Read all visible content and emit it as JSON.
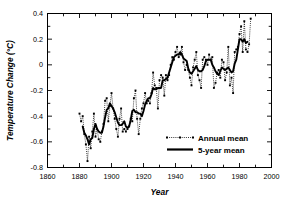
{
  "chart_data": {
    "type": "line",
    "title": "",
    "xlabel": "Year",
    "ylabel": "Temperature Change (°C)",
    "xlim": [
      1860,
      2000
    ],
    "ylim": [
      -0.8,
      0.4
    ],
    "xticks": [
      1860,
      1880,
      1900,
      1920,
      1940,
      1960,
      1980,
      2000
    ],
    "xtick_labels": [
      "1860",
      "1880",
      "1900",
      "1920",
      "1940",
      "1960",
      "1980",
      "2000"
    ],
    "xminor_step": 10,
    "yticks": [
      -0.8,
      -0.6,
      -0.4,
      -0.2,
      0,
      0.2,
      0.4
    ],
    "ytick_labels": [
      "-0.8",
      "-0.6",
      "-0.4",
      "-0.2",
      "0",
      "0.2",
      "0.4"
    ],
    "grid": false,
    "legend_position": "lower-right",
    "frame": true,
    "series": [
      {
        "name": "Annual mean",
        "style": "dotted-with-square-markers",
        "color": "#000000",
        "x": [
          1880,
          1881,
          1882,
          1883,
          1884,
          1885,
          1886,
          1887,
          1888,
          1889,
          1890,
          1891,
          1892,
          1893,
          1894,
          1895,
          1896,
          1897,
          1898,
          1899,
          1900,
          1901,
          1902,
          1903,
          1904,
          1905,
          1906,
          1907,
          1908,
          1909,
          1910,
          1911,
          1912,
          1913,
          1914,
          1915,
          1916,
          1917,
          1918,
          1919,
          1920,
          1921,
          1922,
          1923,
          1924,
          1925,
          1926,
          1927,
          1928,
          1929,
          1930,
          1931,
          1932,
          1933,
          1934,
          1935,
          1936,
          1937,
          1938,
          1939,
          1940,
          1941,
          1942,
          1943,
          1944,
          1945,
          1946,
          1947,
          1948,
          1949,
          1950,
          1951,
          1952,
          1953,
          1954,
          1955,
          1956,
          1957,
          1958,
          1959,
          1960,
          1961,
          1962,
          1963,
          1964,
          1965,
          1966,
          1967,
          1968,
          1969,
          1970,
          1971,
          1972,
          1973,
          1974,
          1975,
          1976,
          1977,
          1978,
          1979,
          1980,
          1981,
          1982,
          1983,
          1984,
          1985,
          1986,
          1987
        ],
        "values": [
          -0.38,
          -0.44,
          -0.4,
          -0.54,
          -0.62,
          -0.75,
          -0.56,
          -0.65,
          -0.52,
          -0.38,
          -0.56,
          -0.5,
          -0.58,
          -0.6,
          -0.52,
          -0.46,
          -0.28,
          -0.26,
          -0.44,
          -0.32,
          -0.22,
          -0.34,
          -0.42,
          -0.5,
          -0.56,
          -0.42,
          -0.34,
          -0.52,
          -0.5,
          -0.52,
          -0.5,
          -0.48,
          -0.42,
          -0.44,
          -0.26,
          -0.2,
          -0.42,
          -0.54,
          -0.42,
          -0.34,
          -0.3,
          -0.22,
          -0.3,
          -0.28,
          -0.3,
          -0.22,
          -0.06,
          -0.16,
          -0.18,
          -0.34,
          -0.12,
          -0.08,
          -0.1,
          -0.24,
          -0.08,
          -0.12,
          -0.08,
          0.0,
          0.06,
          0.04,
          0.1,
          0.14,
          0.06,
          0.08,
          0.14,
          0.02,
          -0.04,
          0.0,
          -0.04,
          -0.1,
          -0.16,
          -0.02,
          0.04,
          0.1,
          -0.08,
          -0.12,
          -0.18,
          0.04,
          0.06,
          0.04,
          0.0,
          0.08,
          0.04,
          0.06,
          -0.18,
          -0.14,
          -0.06,
          -0.04,
          -0.1,
          0.04,
          0.02,
          -0.12,
          -0.06,
          0.14,
          -0.16,
          -0.1,
          -0.22,
          0.1,
          0.12,
          0.14,
          0.24,
          0.3,
          0.1,
          0.34,
          0.12,
          0.1,
          0.16,
          0.36
        ]
      },
      {
        "name": "5-year mean",
        "style": "thick-solid",
        "color": "#000000",
        "x": [
          1882,
          1883,
          1884,
          1885,
          1886,
          1887,
          1888,
          1889,
          1890,
          1891,
          1892,
          1893,
          1894,
          1895,
          1896,
          1897,
          1898,
          1899,
          1900,
          1901,
          1902,
          1903,
          1904,
          1905,
          1906,
          1907,
          1908,
          1909,
          1910,
          1911,
          1912,
          1913,
          1914,
          1915,
          1916,
          1917,
          1918,
          1919,
          1920,
          1921,
          1922,
          1923,
          1924,
          1925,
          1926,
          1927,
          1928,
          1929,
          1930,
          1931,
          1932,
          1933,
          1934,
          1935,
          1936,
          1937,
          1938,
          1939,
          1940,
          1941,
          1942,
          1943,
          1944,
          1945,
          1946,
          1947,
          1948,
          1949,
          1950,
          1951,
          1952,
          1953,
          1954,
          1955,
          1956,
          1957,
          1958,
          1959,
          1960,
          1961,
          1962,
          1963,
          1964,
          1965,
          1966,
          1967,
          1968,
          1969,
          1970,
          1971,
          1972,
          1973,
          1974,
          1975,
          1976,
          1977,
          1978,
          1979,
          1980,
          1981,
          1982,
          1983,
          1984,
          1985
        ],
        "values": [
          -0.48,
          -0.53,
          -0.55,
          -0.58,
          -0.62,
          -0.58,
          -0.57,
          -0.5,
          -0.46,
          -0.5,
          -0.52,
          -0.53,
          -0.53,
          -0.48,
          -0.41,
          -0.35,
          -0.34,
          -0.3,
          -0.32,
          -0.34,
          -0.37,
          -0.41,
          -0.45,
          -0.47,
          -0.47,
          -0.46,
          -0.44,
          -0.48,
          -0.49,
          -0.48,
          -0.43,
          -0.36,
          -0.35,
          -0.37,
          -0.37,
          -0.38,
          -0.38,
          -0.4,
          -0.36,
          -0.31,
          -0.28,
          -0.26,
          -0.26,
          -0.23,
          -0.18,
          -0.19,
          -0.19,
          -0.18,
          -0.18,
          -0.18,
          -0.12,
          -0.12,
          -0.11,
          -0.1,
          -0.06,
          -0.02,
          0.02,
          0.06,
          0.07,
          0.08,
          0.08,
          0.1,
          0.08,
          0.05,
          0.04,
          0.03,
          -0.03,
          -0.06,
          -0.07,
          -0.05,
          -0.03,
          -0.01,
          -0.04,
          -0.05,
          -0.05,
          -0.04,
          -0.01,
          0.03,
          0.04,
          0.04,
          0.04,
          0.0,
          -0.02,
          -0.05,
          -0.07,
          -0.08,
          -0.05,
          -0.02,
          -0.03,
          -0.04,
          -0.03,
          -0.02,
          -0.04,
          -0.06,
          -0.05,
          0.01,
          0.04,
          0.12,
          0.2,
          0.2,
          0.18,
          0.2,
          0.17,
          0.18
        ]
      }
    ]
  },
  "legend": {
    "entries": [
      {
        "label": "Annual mean",
        "style": "dotted-marker"
      },
      {
        "label": "5-year mean",
        "style": "solid-thick"
      }
    ]
  }
}
